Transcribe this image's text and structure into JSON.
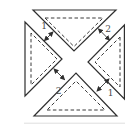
{
  "diagram": {
    "gap_labels": {
      "top_left": "1",
      "top_right": "2",
      "bottom_left": "2",
      "bottom_right": "1"
    },
    "colors": {
      "line": "#2f2f2f",
      "label": "#4a4a4a",
      "background": "#ffffff"
    }
  }
}
